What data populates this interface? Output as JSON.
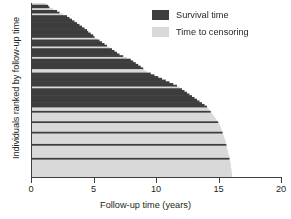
{
  "chart_data": {
    "type": "bar",
    "orientation": "horizontal",
    "title": "",
    "xlabel": "Follow-up time (years)",
    "ylabel": "Individuals ranked by follow-up time",
    "xlim": [
      0,
      20
    ],
    "xticks": [
      0,
      5,
      10,
      15,
      20
    ],
    "xticklabels": [
      "0",
      "5",
      "10",
      "15",
      "20"
    ],
    "ylim": [
      0,
      100
    ],
    "yticks": [],
    "grid": false,
    "legend_position": "top-right",
    "colors": {
      "survival": "#3d3d3d",
      "censoring": "#d9d9d9",
      "axis": "#3f3f3f",
      "background": "#ffffff"
    },
    "series": [
      {
        "name": "Survival time",
        "color": "#3d3d3d"
      },
      {
        "name": "Time to censoring",
        "color": "#d9d9d9"
      }
    ],
    "note": "Each horizontal bar is one individual, sorted by follow-up time; bar length = follow-up time in years; bar colour = event (survival time) or censored (time to censoring).",
    "bars": [
      {
        "value": 1.1,
        "status": "censored"
      },
      {
        "value": 1.3,
        "status": "event"
      },
      {
        "value": 1.4,
        "status": "event"
      },
      {
        "value": 1.7,
        "status": "censored"
      },
      {
        "value": 2.0,
        "status": "event"
      },
      {
        "value": 2.2,
        "status": "event"
      },
      {
        "value": 2.5,
        "status": "censored"
      },
      {
        "value": 2.8,
        "status": "event"
      },
      {
        "value": 3.0,
        "status": "event"
      },
      {
        "value": 3.2,
        "status": "event"
      },
      {
        "value": 3.4,
        "status": "event"
      },
      {
        "value": 3.6,
        "status": "event"
      },
      {
        "value": 3.8,
        "status": "event"
      },
      {
        "value": 4.0,
        "status": "event"
      },
      {
        "value": 4.2,
        "status": "event"
      },
      {
        "value": 4.4,
        "status": "event"
      },
      {
        "value": 4.5,
        "status": "event"
      },
      {
        "value": 4.7,
        "status": "event"
      },
      {
        "value": 4.9,
        "status": "event"
      },
      {
        "value": 5.0,
        "status": "event"
      },
      {
        "value": 5.2,
        "status": "censored"
      },
      {
        "value": 5.4,
        "status": "event"
      },
      {
        "value": 5.6,
        "status": "event"
      },
      {
        "value": 5.8,
        "status": "event"
      },
      {
        "value": 6.0,
        "status": "event"
      },
      {
        "value": 6.2,
        "status": "censored"
      },
      {
        "value": 6.4,
        "status": "event"
      },
      {
        "value": 6.6,
        "status": "event"
      },
      {
        "value": 6.8,
        "status": "event"
      },
      {
        "value": 7.0,
        "status": "event"
      },
      {
        "value": 7.3,
        "status": "event"
      },
      {
        "value": 7.6,
        "status": "censored"
      },
      {
        "value": 7.9,
        "status": "event"
      },
      {
        "value": 8.1,
        "status": "event"
      },
      {
        "value": 8.3,
        "status": "event"
      },
      {
        "value": 8.5,
        "status": "event"
      },
      {
        "value": 8.7,
        "status": "event"
      },
      {
        "value": 8.9,
        "status": "event"
      },
      {
        "value": 9.0,
        "status": "censored"
      },
      {
        "value": 9.2,
        "status": "censored"
      },
      {
        "value": 9.5,
        "status": "event"
      },
      {
        "value": 9.8,
        "status": "event"
      },
      {
        "value": 10.1,
        "status": "event"
      },
      {
        "value": 10.4,
        "status": "event"
      },
      {
        "value": 10.7,
        "status": "event"
      },
      {
        "value": 11.0,
        "status": "event"
      },
      {
        "value": 11.3,
        "status": "event"
      },
      {
        "value": 11.6,
        "status": "event"
      },
      {
        "value": 11.8,
        "status": "censored"
      },
      {
        "value": 12.0,
        "status": "event"
      },
      {
        "value": 12.2,
        "status": "event"
      },
      {
        "value": 12.4,
        "status": "event"
      },
      {
        "value": 12.6,
        "status": "event"
      },
      {
        "value": 12.8,
        "status": "event"
      },
      {
        "value": 13.0,
        "status": "event"
      },
      {
        "value": 13.2,
        "status": "event"
      },
      {
        "value": 13.4,
        "status": "event"
      },
      {
        "value": 13.6,
        "status": "event"
      },
      {
        "value": 13.8,
        "status": "event"
      },
      {
        "value": 14.0,
        "status": "event"
      },
      {
        "value": 14.1,
        "status": "censored"
      },
      {
        "value": 14.2,
        "status": "censored"
      },
      {
        "value": 14.3,
        "status": "event"
      },
      {
        "value": 14.4,
        "status": "censored"
      },
      {
        "value": 14.5,
        "status": "censored"
      },
      {
        "value": 14.6,
        "status": "censored"
      },
      {
        "value": 14.7,
        "status": "censored"
      },
      {
        "value": 14.8,
        "status": "censored"
      },
      {
        "value": 14.9,
        "status": "event"
      },
      {
        "value": 15.0,
        "status": "censored"
      },
      {
        "value": 15.05,
        "status": "censored"
      },
      {
        "value": 15.1,
        "status": "censored"
      },
      {
        "value": 15.15,
        "status": "censored"
      },
      {
        "value": 15.2,
        "status": "censored"
      },
      {
        "value": 15.25,
        "status": "event"
      },
      {
        "value": 15.3,
        "status": "censored"
      },
      {
        "value": 15.35,
        "status": "censored"
      },
      {
        "value": 15.4,
        "status": "censored"
      },
      {
        "value": 15.45,
        "status": "censored"
      },
      {
        "value": 15.5,
        "status": "censored"
      },
      {
        "value": 15.5,
        "status": "censored"
      },
      {
        "value": 15.55,
        "status": "event"
      },
      {
        "value": 15.6,
        "status": "censored"
      },
      {
        "value": 15.6,
        "status": "censored"
      },
      {
        "value": 15.65,
        "status": "censored"
      },
      {
        "value": 15.7,
        "status": "censored"
      },
      {
        "value": 15.7,
        "status": "censored"
      },
      {
        "value": 15.75,
        "status": "censored"
      },
      {
        "value": 15.8,
        "status": "censored"
      },
      {
        "value": 15.8,
        "status": "event"
      },
      {
        "value": 15.85,
        "status": "censored"
      },
      {
        "value": 15.85,
        "status": "censored"
      },
      {
        "value": 15.9,
        "status": "censored"
      },
      {
        "value": 15.9,
        "status": "censored"
      },
      {
        "value": 15.9,
        "status": "censored"
      },
      {
        "value": 15.95,
        "status": "censored"
      },
      {
        "value": 15.95,
        "status": "censored"
      },
      {
        "value": 16.0,
        "status": "censored"
      },
      {
        "value": 16.0,
        "status": "censored"
      },
      {
        "value": 16.0,
        "status": "censored"
      }
    ]
  },
  "legend": {
    "items": [
      {
        "label": "Survival time",
        "color": "#3d3d3d"
      },
      {
        "label": "Time to censoring",
        "color": "#d9d9d9"
      }
    ]
  },
  "axes": {
    "x": {
      "label": "Follow-up time (years)",
      "ticklabels": [
        "0",
        "5",
        "10",
        "15",
        "20"
      ]
    },
    "y": {
      "label": "Individuals ranked by follow-up time"
    }
  }
}
